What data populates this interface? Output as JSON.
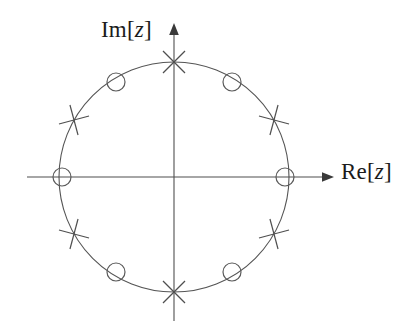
{
  "figure": {
    "background_color": "#ffffff",
    "stroke_color": "#555555",
    "axis_color": "#4a4a4a",
    "text_color": "#1b1b1b",
    "width": 407,
    "height": 334
  },
  "labels": {
    "imaginary_axis_prefix": "Im[",
    "imaginary_axis_var": "z",
    "imaginary_axis_suffix": "]",
    "imaginary_axis_full": "Im[z]",
    "real_axis_prefix": "Re[",
    "real_axis_var": "z",
    "real_axis_suffix": "]",
    "real_axis_full": "Re[z]"
  },
  "chart_data": {
    "type": "scatter",
    "title": "",
    "subtitle": "",
    "xlabel": "Re[z]",
    "ylabel": "Im[z]",
    "xlim": [
      -1.3,
      1.36
    ],
    "ylim": [
      -1.32,
      1.32
    ],
    "grid": false,
    "legend": null,
    "annotations": [],
    "unit_circle": {
      "drawn": true,
      "radius": 1.0,
      "center": [
        0,
        0
      ],
      "center_px": [
        174,
        177
      ],
      "radius_px": 115,
      "stroke": "#555555",
      "stroke_width_px": 1.1
    },
    "axes": {
      "x_axis": {
        "from_px": [
          27,
          177
        ],
        "to_px": [
          332,
          177
        ],
        "arrow_at": "right"
      },
      "y_axis": {
        "from_px": [
          174,
          321
        ],
        "to_px": [
          174,
          25
        ],
        "arrow_at": "top"
      }
    },
    "series": [
      {
        "name": "zeros",
        "marker": "circle",
        "marker_radius_px": 9,
        "count": 6,
        "angles_deg": [
          0,
          60,
          120,
          180,
          240,
          300
        ],
        "points": [
          {
            "angle_deg": 0,
            "re": 1.0,
            "im": 0.0,
            "px": [
              285,
              177
            ]
          },
          {
            "angle_deg": 60,
            "re": 0.5,
            "im": 0.866,
            "px": [
              232,
              82
            ]
          },
          {
            "angle_deg": 120,
            "re": -0.5,
            "im": 0.866,
            "px": [
              116,
              82
            ]
          },
          {
            "angle_deg": 180,
            "re": -1.0,
            "im": 0.0,
            "px": [
              62,
              177
            ]
          },
          {
            "angle_deg": 240,
            "re": -0.5,
            "im": -0.866,
            "px": [
              116,
              272
            ]
          },
          {
            "angle_deg": 300,
            "re": 0.5,
            "im": -0.866,
            "px": [
              232,
              272
            ]
          }
        ]
      },
      {
        "name": "poles",
        "marker": "cross",
        "marker_arm_px": 11,
        "count": 6,
        "angles_deg": [
          30,
          90,
          150,
          210,
          270,
          330
        ],
        "points": [
          {
            "angle_deg": 30,
            "re": 0.866,
            "im": 0.5,
            "px": [
              274,
              120
            ]
          },
          {
            "angle_deg": 90,
            "re": 0.0,
            "im": 1.0,
            "px": [
              174,
              62
            ]
          },
          {
            "angle_deg": 150,
            "re": -0.866,
            "im": 0.5,
            "px": [
              74,
              120
            ]
          },
          {
            "angle_deg": 210,
            "re": -0.866,
            "im": -0.5,
            "px": [
              74,
              234
            ]
          },
          {
            "angle_deg": 270,
            "re": 0.0,
            "im": -1.0,
            "px": [
              174,
              292
            ]
          },
          {
            "angle_deg": 330,
            "re": 0.866,
            "im": -0.5,
            "px": [
              274,
              234
            ]
          }
        ]
      }
    ]
  }
}
